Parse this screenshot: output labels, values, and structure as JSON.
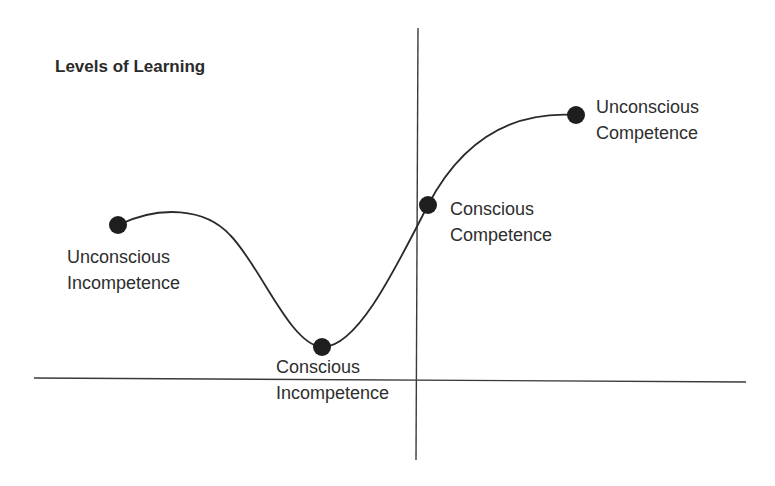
{
  "title": "Levels of Learning",
  "colors": {
    "background": "#ffffff",
    "ink": "#2a2a2a",
    "curve": "#2a2a2a",
    "point": "#1e1e1e"
  },
  "axes": {
    "vertical": {
      "x": 418,
      "y_top": 28,
      "y_bottom": 460
    },
    "horizontal": {
      "y_left": 378,
      "y_right": 382,
      "x_left": 34,
      "x_right": 746
    }
  },
  "stages": [
    {
      "id": "unconscious-incompetence",
      "line1": "Unconscious",
      "line2": "Incompetence",
      "point": {
        "x": 118,
        "y": 225
      },
      "label_pos": {
        "x": 67,
        "y": 244
      }
    },
    {
      "id": "conscious-incompetence",
      "line1": "Conscious",
      "line2": "Incompetence",
      "point": {
        "x": 322,
        "y": 347
      },
      "label_pos": {
        "x": 276,
        "y": 354
      }
    },
    {
      "id": "conscious-competence",
      "line1": "Conscious",
      "line2": "Competence",
      "point": {
        "x": 428,
        "y": 205
      },
      "label_pos": {
        "x": 450,
        "y": 196
      }
    },
    {
      "id": "unconscious-competence",
      "line1": "Unconscious",
      "line2": "Competence",
      "point": {
        "x": 576,
        "y": 115
      },
      "label_pos": {
        "x": 596,
        "y": 94
      }
    }
  ]
}
